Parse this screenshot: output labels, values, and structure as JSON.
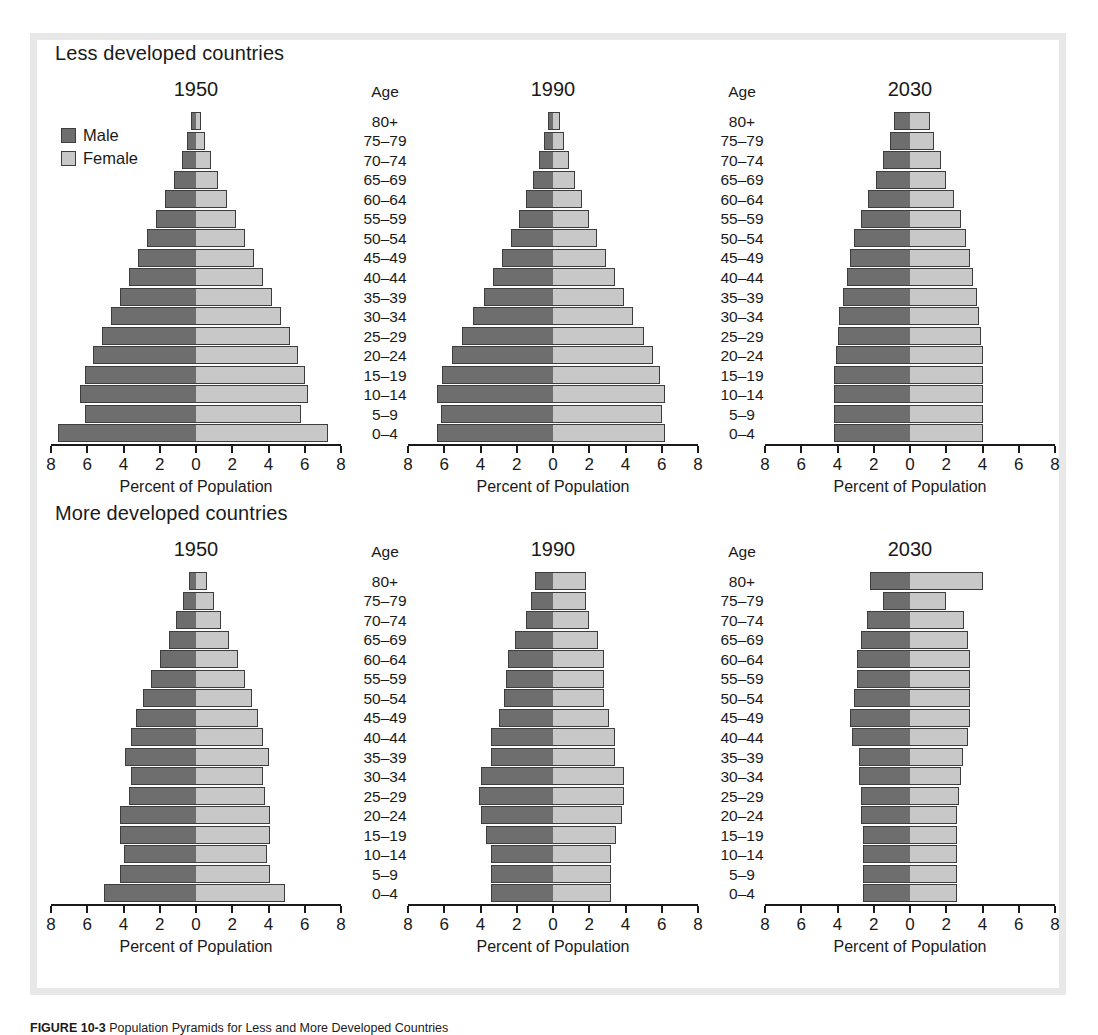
{
  "figure": {
    "caption_label": "FIGURE 10-3",
    "caption_text": "Population Pyramids for Less and More Developed Countries"
  },
  "legend": {
    "male_label": "Male",
    "female_label": "Female",
    "male_color": "#6e6e6e",
    "female_color": "#c8c8c8"
  },
  "axis": {
    "caption": "Percent of Population",
    "tick_labels": [
      "8",
      "6",
      "4",
      "2",
      "0",
      "2",
      "4",
      "6",
      "8"
    ],
    "tick_values": [
      -8,
      -6,
      -4,
      -2,
      0,
      2,
      4,
      6,
      8
    ],
    "limit": 8
  },
  "age_header": "Age",
  "age_groups": [
    "80+",
    "75–79",
    "70–74",
    "65–69",
    "60–64",
    "55–59",
    "50–54",
    "45–49",
    "40–44",
    "35–39",
    "30–34",
    "25–29",
    "20–24",
    "15–19",
    "10–14",
    "5–9",
    "0–4"
  ],
  "sections": [
    {
      "id": "less-developed",
      "title": "Less developed countries"
    },
    {
      "id": "more-developed",
      "title": "More developed countries"
    }
  ],
  "chart_data": [
    {
      "type": "bar",
      "subtype": "population-pyramid",
      "section": "Less developed countries",
      "title": "1950",
      "xlabel": "Percent of Population",
      "ylabel": "Age",
      "xlim": [
        -8,
        8
      ],
      "grid": false,
      "categories": [
        "80+",
        "75–79",
        "70–74",
        "65–69",
        "60–64",
        "55–59",
        "50–54",
        "45–49",
        "40–44",
        "35–39",
        "30–34",
        "25–29",
        "20–24",
        "15–19",
        "10–14",
        "5–9",
        "0–4"
      ],
      "series": [
        {
          "name": "Male",
          "values": [
            0.3,
            0.5,
            0.8,
            1.2,
            1.7,
            2.2,
            2.7,
            3.2,
            3.7,
            4.2,
            4.7,
            5.2,
            5.7,
            6.1,
            6.4,
            6.1,
            7.6
          ]
        },
        {
          "name": "Female",
          "values": [
            0.3,
            0.5,
            0.8,
            1.2,
            1.7,
            2.2,
            2.7,
            3.2,
            3.7,
            4.2,
            4.7,
            5.2,
            5.6,
            6.0,
            6.2,
            5.8,
            7.3
          ]
        }
      ]
    },
    {
      "type": "bar",
      "subtype": "population-pyramid",
      "section": "Less developed countries",
      "title": "1990",
      "xlabel": "Percent of Population",
      "ylabel": "Age",
      "xlim": [
        -8,
        8
      ],
      "grid": false,
      "categories": [
        "80+",
        "75–79",
        "70–74",
        "65–69",
        "60–64",
        "55–59",
        "50–54",
        "45–49",
        "40–44",
        "35–39",
        "30–34",
        "25–29",
        "20–24",
        "15–19",
        "10–14",
        "5–9",
        "0–4"
      ],
      "series": [
        {
          "name": "Male",
          "values": [
            0.3,
            0.5,
            0.8,
            1.1,
            1.5,
            1.9,
            2.3,
            2.8,
            3.3,
            3.8,
            4.4,
            5.0,
            5.6,
            6.1,
            6.4,
            6.2,
            6.4
          ]
        },
        {
          "name": "Female",
          "values": [
            0.4,
            0.6,
            0.9,
            1.2,
            1.6,
            2.0,
            2.4,
            2.9,
            3.4,
            3.9,
            4.4,
            5.0,
            5.5,
            5.9,
            6.2,
            6.0,
            6.2
          ]
        }
      ]
    },
    {
      "type": "bar",
      "subtype": "population-pyramid",
      "section": "Less developed countries",
      "title": "2030",
      "xlabel": "Percent of Population",
      "ylabel": "Age",
      "xlim": [
        -8,
        8
      ],
      "grid": false,
      "categories": [
        "80+",
        "75–79",
        "70–74",
        "65–69",
        "60–64",
        "55–59",
        "50–54",
        "45–49",
        "40–44",
        "35–39",
        "30–34",
        "25–29",
        "20–24",
        "15–19",
        "10–14",
        "5–9",
        "0–4"
      ],
      "series": [
        {
          "name": "Male",
          "values": [
            0.9,
            1.1,
            1.5,
            1.9,
            2.3,
            2.7,
            3.1,
            3.3,
            3.5,
            3.7,
            3.9,
            4.0,
            4.1,
            4.2,
            4.2,
            4.2,
            4.2
          ]
        },
        {
          "name": "Female",
          "values": [
            1.1,
            1.3,
            1.7,
            2.0,
            2.4,
            2.8,
            3.1,
            3.3,
            3.5,
            3.7,
            3.8,
            3.9,
            4.0,
            4.0,
            4.0,
            4.0,
            4.0
          ]
        }
      ]
    },
    {
      "type": "bar",
      "subtype": "population-pyramid",
      "section": "More developed countries",
      "title": "1950",
      "xlabel": "Percent of Population",
      "ylabel": "Age",
      "xlim": [
        -8,
        8
      ],
      "grid": false,
      "categories": [
        "80+",
        "75–79",
        "70–74",
        "65–69",
        "60–64",
        "55–59",
        "50–54",
        "45–49",
        "40–44",
        "35–39",
        "30–34",
        "25–29",
        "20–24",
        "15–19",
        "10–14",
        "5–9",
        "0–4"
      ],
      "series": [
        {
          "name": "Male",
          "values": [
            0.4,
            0.7,
            1.1,
            1.5,
            2.0,
            2.5,
            2.9,
            3.3,
            3.6,
            3.9,
            3.6,
            3.7,
            4.2,
            4.2,
            4.0,
            4.2,
            5.1
          ]
        },
        {
          "name": "Female",
          "values": [
            0.6,
            1.0,
            1.4,
            1.8,
            2.3,
            2.7,
            3.1,
            3.4,
            3.7,
            4.0,
            3.7,
            3.8,
            4.1,
            4.1,
            3.9,
            4.1,
            4.9
          ]
        }
      ]
    },
    {
      "type": "bar",
      "subtype": "population-pyramid",
      "section": "More developed countries",
      "title": "1990",
      "xlabel": "Percent of Population",
      "ylabel": "Age",
      "xlim": [
        -8,
        8
      ],
      "grid": false,
      "categories": [
        "80+",
        "75–79",
        "70–74",
        "65–69",
        "60–64",
        "55–59",
        "50–54",
        "45–49",
        "40–44",
        "35–39",
        "30–34",
        "25–29",
        "20–24",
        "15–19",
        "10–14",
        "5–9",
        "0–4"
      ],
      "series": [
        {
          "name": "Male",
          "values": [
            1.0,
            1.2,
            1.5,
            2.1,
            2.5,
            2.6,
            2.7,
            3.0,
            3.4,
            3.4,
            4.0,
            4.1,
            4.0,
            3.7,
            3.4,
            3.4,
            3.4
          ]
        },
        {
          "name": "Female",
          "values": [
            1.8,
            1.8,
            2.0,
            2.5,
            2.8,
            2.8,
            2.8,
            3.1,
            3.4,
            3.4,
            3.9,
            3.9,
            3.8,
            3.5,
            3.2,
            3.2,
            3.2
          ]
        }
      ]
    },
    {
      "type": "bar",
      "subtype": "population-pyramid",
      "section": "More developed countries",
      "title": "2030",
      "xlabel": "Percent of Population",
      "ylabel": "Age",
      "xlim": [
        -8,
        8
      ],
      "grid": false,
      "categories": [
        "80+",
        "75–79",
        "70–74",
        "65–69",
        "60–64",
        "55–59",
        "50–54",
        "45–49",
        "40–44",
        "35–39",
        "30–34",
        "25–29",
        "20–24",
        "15–19",
        "10–14",
        "5–9",
        "0–4"
      ],
      "series": [
        {
          "name": "Male",
          "values": [
            2.2,
            1.5,
            2.4,
            2.7,
            2.9,
            2.9,
            3.1,
            3.3,
            3.2,
            2.8,
            2.8,
            2.7,
            2.7,
            2.6,
            2.6,
            2.6,
            2.6
          ]
        },
        {
          "name": "Female",
          "values": [
            4.0,
            2.0,
            3.0,
            3.2,
            3.3,
            3.3,
            3.3,
            3.3,
            3.2,
            2.9,
            2.8,
            2.7,
            2.6,
            2.6,
            2.6,
            2.6,
            2.6
          ]
        }
      ]
    }
  ]
}
